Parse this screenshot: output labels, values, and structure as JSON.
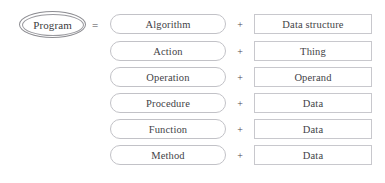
{
  "diagram": {
    "type": "equation-diagram",
    "subject": {
      "label": "Program",
      "shape": "double-ellipse"
    },
    "operators": {
      "equals": "=",
      "plus": "+"
    },
    "rows": [
      {
        "left": "Algorithm",
        "operator": "+",
        "right": "Data structure"
      },
      {
        "left": "Action",
        "operator": "+",
        "right": "Thing"
      },
      {
        "left": "Operation",
        "operator": "+",
        "right": "Operand"
      },
      {
        "left": "Procedure",
        "operator": "+",
        "right": "Data"
      },
      {
        "left": "Function",
        "operator": "+",
        "right": "Data"
      },
      {
        "left": "Method",
        "operator": "+",
        "right": "Data"
      }
    ],
    "colors": {
      "background": "#ffffff",
      "text": "#434347",
      "subject_text": "#3c3c40",
      "rounded_box_border": "#c2c2c7",
      "rect_box_border": "#c8c8cd",
      "ellipse_border": "#8d8d92",
      "operator_text": "#4a4a4e"
    }
  }
}
